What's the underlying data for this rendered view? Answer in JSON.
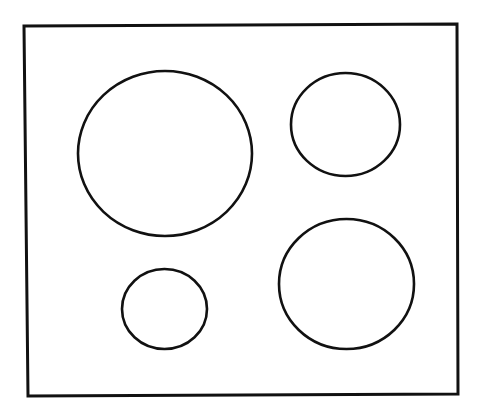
{
  "diagram": {
    "background": "#ffffff",
    "stroke_color": "#111111",
    "frame": {
      "points": [
        [
          24,
          26
        ],
        [
          457,
          24
        ],
        [
          458,
          394
        ],
        [
          28,
          396
        ]
      ]
    },
    "circles": [
      {
        "id": "circle-large-top-left",
        "cx": 165,
        "cy": 153.5,
        "rx": 87,
        "ry": 82.5
      },
      {
        "id": "circle-medium-top-right",
        "cx": 345.5,
        "cy": 124.5,
        "rx": 54.5,
        "ry": 51.5
      },
      {
        "id": "circle-small-bottom-left",
        "cx": 164.5,
        "cy": 309,
        "rx": 42.5,
        "ry": 40
      },
      {
        "id": "circle-large-bottom-right",
        "cx": 346.5,
        "cy": 284,
        "rx": 67.5,
        "ry": 65
      }
    ]
  }
}
